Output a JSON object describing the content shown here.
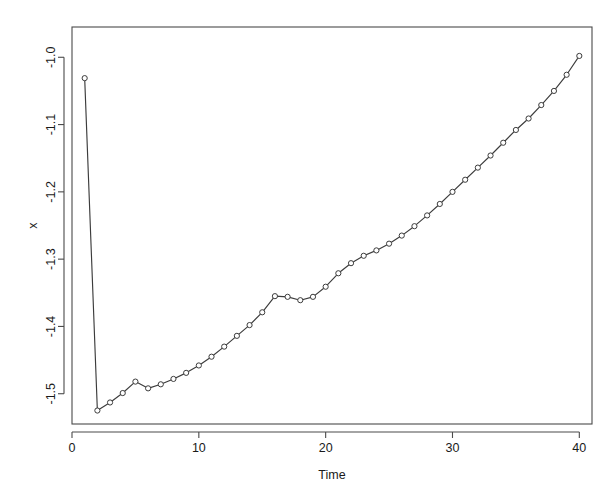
{
  "chart_data": {
    "type": "line",
    "title": "",
    "subtitle": "",
    "xlabel": "Time",
    "ylabel": "x",
    "grid": false,
    "legend": false,
    "legend_position": "none",
    "marker": "open-circle",
    "line_color": "#3c3c3c",
    "marker_fill": "#ffffff",
    "axis_color": "#4a4a4a",
    "xlim": [
      0.0,
      41.0
    ],
    "ylim": [
      -1.545,
      -0.955
    ],
    "xticks": [
      0,
      10,
      20,
      30,
      40
    ],
    "xtick_labels": [
      "0",
      "10",
      "20",
      "30",
      "40"
    ],
    "yticks": [
      -1.0,
      -1.1,
      -1.2,
      -1.3,
      -1.4,
      -1.5
    ],
    "ytick_labels": [
      "-1.0",
      "-1.1",
      "-1.2",
      "-1.3",
      "-1.4",
      "-1.5"
    ],
    "ytick_rotation": 90,
    "x": [
      1,
      2,
      3,
      4,
      5,
      6,
      7,
      8,
      9,
      10,
      11,
      12,
      13,
      14,
      15,
      16,
      17,
      18,
      19,
      20,
      21,
      22,
      23,
      24,
      25,
      26,
      27,
      28,
      29,
      30,
      31,
      32,
      33,
      34,
      35,
      36,
      37,
      38,
      39,
      40
    ],
    "series": [
      {
        "name": "x",
        "values": [
          -1.031,
          -1.525,
          -1.513,
          -1.499,
          -1.482,
          -1.492,
          -1.486,
          -1.478,
          -1.469,
          -1.458,
          -1.445,
          -1.43,
          -1.414,
          -1.398,
          -1.379,
          -1.355,
          -1.356,
          -1.361,
          -1.356,
          -1.341,
          -1.321,
          -1.306,
          -1.295,
          -1.287,
          -1.277,
          -1.265,
          -1.251,
          -1.235,
          -1.218,
          -1.2,
          -1.182,
          -1.164,
          -1.146,
          -1.127,
          -1.108,
          -1.091,
          -1.071,
          -1.05,
          -1.026,
          -0.998
        ]
      }
    ]
  }
}
